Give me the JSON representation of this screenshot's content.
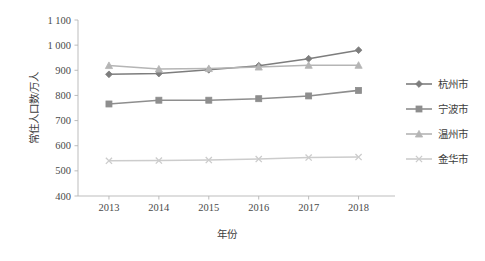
{
  "chart_data": {
    "type": "line",
    "title": "",
    "xlabel": "年份",
    "ylabel": "常住人口数/万人",
    "categories": [
      "2013",
      "2014",
      "2015",
      "2016",
      "2017",
      "2018"
    ],
    "x_tick_labels": [
      "2013",
      "2014",
      "2015",
      "2016",
      "2017",
      "2018"
    ],
    "y_tick_labels": [
      "400",
      "500",
      "600",
      "700",
      "800",
      "900",
      "1 000",
      "1 100"
    ],
    "y_ticks": [
      400,
      500,
      600,
      700,
      800,
      900,
      1000,
      1100
    ],
    "ylim": [
      400,
      1100
    ],
    "grid": false,
    "legend_position": "right",
    "series": [
      {
        "name": "杭州市",
        "marker": "diamond",
        "color": "#7d7d7d",
        "values": [
          884,
          887,
          902,
          918,
          946,
          980
        ]
      },
      {
        "name": "宁波市",
        "marker": "square",
        "color": "#8e8e8e",
        "values": [
          766,
          781,
          781,
          787,
          798,
          820
        ]
      },
      {
        "name": "温州市",
        "marker": "triangle",
        "color": "#b5b5b5",
        "values": [
          919,
          905,
          907,
          913,
          920,
          920
        ]
      },
      {
        "name": "金华市",
        "marker": "x",
        "color": "#cccccc",
        "values": [
          540,
          541,
          543,
          547,
          553,
          555
        ]
      }
    ]
  },
  "legend": {
    "items": [
      {
        "label": "杭州市"
      },
      {
        "label": "宁波市"
      },
      {
        "label": "温州市"
      },
      {
        "label": "金华市"
      }
    ]
  },
  "colors": {
    "axis": "#b6b6b6",
    "text": "#3d3d3d",
    "background": "#ffffff"
  }
}
